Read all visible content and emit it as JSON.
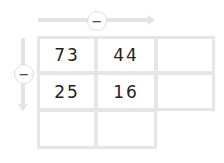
{
  "operators": {
    "horizontal": "−",
    "vertical": "−"
  },
  "grid": {
    "rows": [
      [
        "73",
        "44",
        ""
      ],
      [
        "25",
        "16",
        ""
      ],
      [
        "",
        ""
      ]
    ]
  },
  "colors": {
    "border": "#e6e6e6",
    "arrow": "#e3e3e3",
    "text": "#222222"
  }
}
